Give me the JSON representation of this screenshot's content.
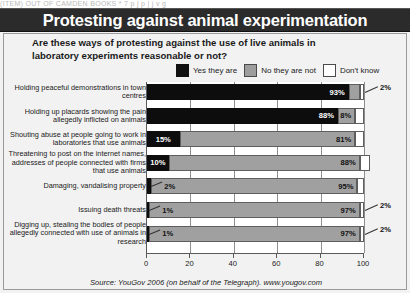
{
  "scan_strip_text": "(ITEM)  OUT  OF  CAMDEN  BOOKS   *   7   p   j   p   |     j                         v   g",
  "title": "Protesting against animal experimentation",
  "subtitle": "Are these ways of protesting against the use of live animals in laboratory experiments reasonable or not?",
  "source": "Source: YouGov 2006 (on behalf of the Telegraph). www.yougov.com",
  "legend": [
    {
      "label": "Yes they are",
      "color": "#0d0d0d",
      "key": "yes"
    },
    {
      "label": "No they are not",
      "color": "#a0a0a0",
      "key": "no"
    },
    {
      "label": "Don't know",
      "color": "#ffffff",
      "key": "dont_know"
    }
  ],
  "chart_data": {
    "type": "bar",
    "orientation": "horizontal",
    "stacked": true,
    "title": "Protesting against animal experimentation",
    "subtitle": "Are these ways of protesting against the use of live animals in laboratory experiments reasonable or not?",
    "xlabel": "",
    "ylabel": "",
    "xlim": [
      0,
      100
    ],
    "xticks": [
      0,
      20,
      40,
      60,
      80,
      100
    ],
    "grid": true,
    "legend_position": "top",
    "categories": [
      "Holding peaceful demonstrations in town centres",
      "Holding up placards showing the pain allegedly inflicted on animals",
      "Shouting abuse at people going to work in laboratories that use animals",
      "Threatening to post on the internet names, addresses of people connected with firms that use animals",
      "Damaging, vandalising property",
      "Issuing death threats",
      "Digging up, stealing the bodies of people allegedly connected with use of animals in research"
    ],
    "series": [
      {
        "name": "Yes they are",
        "values": [
          93,
          88,
          15,
          10,
          2,
          1,
          1
        ]
      },
      {
        "name": "No they are not",
        "values": [
          5,
          8,
          81,
          88,
          95,
          97,
          97
        ]
      },
      {
        "name": "Don't know",
        "values": [
          2,
          4,
          4,
          5,
          3,
          2,
          2
        ]
      }
    ],
    "data_labels": [
      {
        "yes": "93%",
        "no": "5",
        "dont_know": "2%"
      },
      {
        "yes": "88%",
        "no": "8%",
        "dont_know": "4"
      },
      {
        "yes": "15%",
        "no": "81%",
        "dont_know": "4"
      },
      {
        "yes": "10%",
        "no": "88%",
        "dont_know": "5"
      },
      {
        "yes": "2%",
        "no": "95%",
        "dont_know": "3"
      },
      {
        "yes": "1%",
        "no": "97%",
        "dont_know": "2%"
      },
      {
        "yes": "1%",
        "no": "97%",
        "dont_know": "2%"
      }
    ]
  }
}
